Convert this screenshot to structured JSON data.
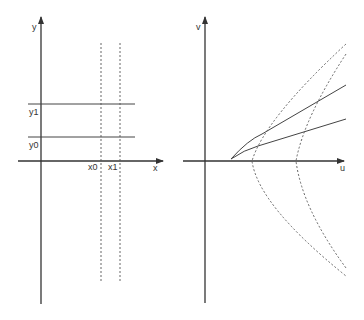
{
  "colors": {
    "axis": "#333333",
    "line": "#444444",
    "dashed": "#555555",
    "background": "#ffffff"
  },
  "left_panel": {
    "x_axis_label": "x",
    "y_axis_label": "y",
    "vertical_markers": [
      {
        "label": "x0"
      },
      {
        "label": "x1"
      }
    ],
    "horizontal_markers": [
      {
        "label": "y1"
      },
      {
        "label": "y0"
      }
    ]
  },
  "right_panel": {
    "u_axis_label": "u",
    "v_axis_label": "v",
    "solid_curves": [
      {
        "name": "image-of-y1"
      },
      {
        "name": "image-of-y0"
      }
    ],
    "dashed_curves": [
      {
        "name": "image-of-x0"
      },
      {
        "name": "image-of-x1"
      }
    ]
  }
}
